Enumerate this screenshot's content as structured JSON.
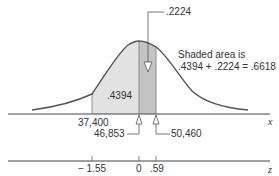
{
  "diagram": {
    "type": "normal-distribution-shaded-area",
    "callout_top": ".2224",
    "annotation": {
      "line1": "Shaded area is",
      "line2": ".4394 + .2224 = .6618"
    },
    "left_area_label": ".4394",
    "x_axis": {
      "label": "x",
      "ticks": [
        {
          "value": "37,400"
        },
        {
          "value": "46,853"
        },
        {
          "value": "50,460"
        }
      ]
    },
    "z_axis": {
      "label": "z",
      "ticks": [
        {
          "value": "− 1.55"
        },
        {
          "value": "0"
        },
        {
          "value": ".59"
        }
      ]
    },
    "colors": {
      "curve": "#555555",
      "left_shade": "#e2e2e2",
      "right_shade": "#c4c4c4",
      "axis": "#444444"
    }
  }
}
